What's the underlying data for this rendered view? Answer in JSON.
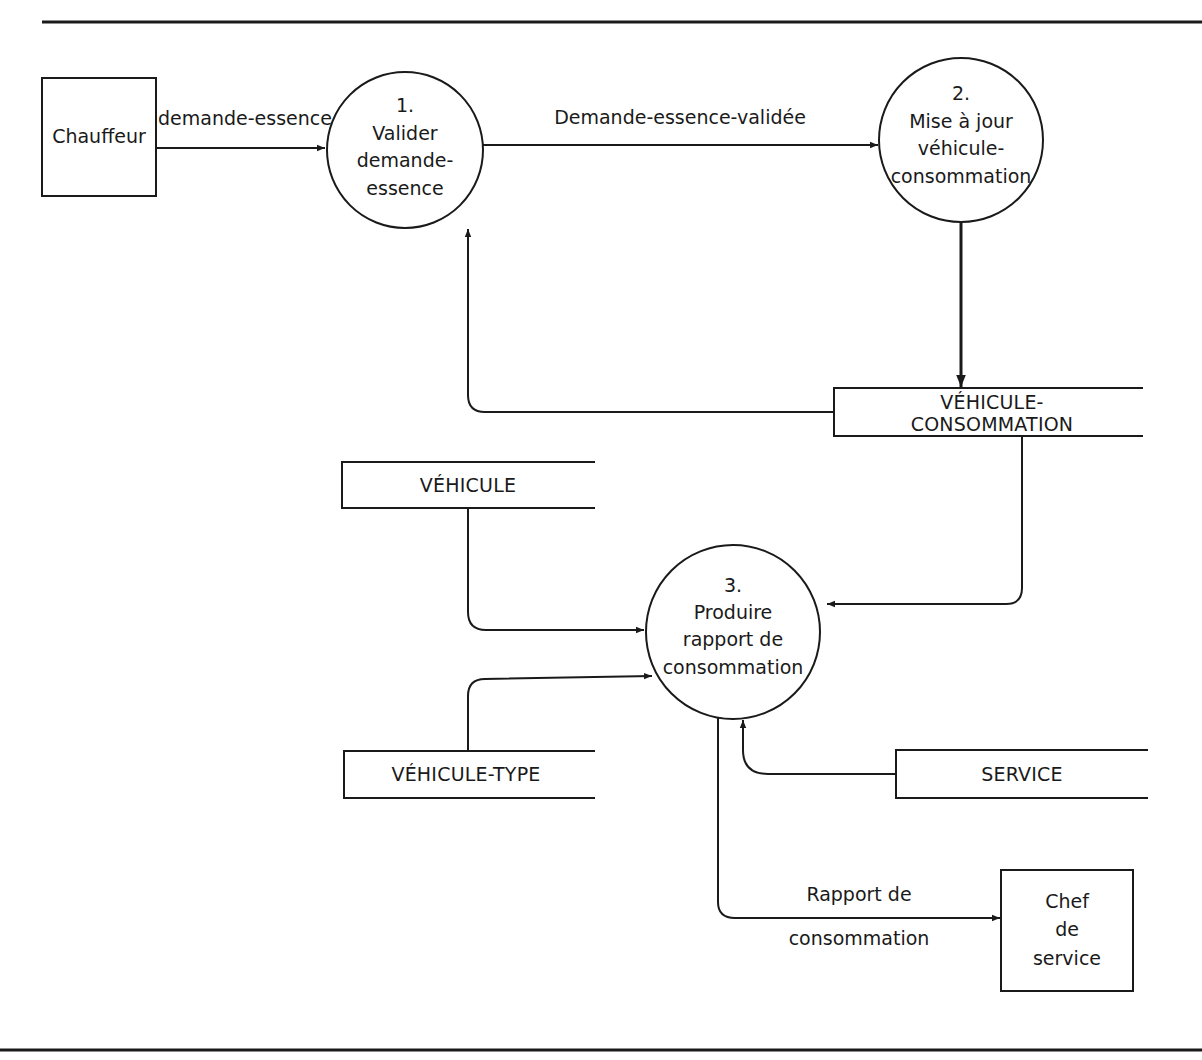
{
  "diagram": {
    "type": "data-flow-diagram",
    "colors": {
      "ink": "#1a1a1a",
      "background": "#ffffff"
    },
    "external_entities": [
      {
        "id": "chauffeur",
        "lines": [
          "Chauffeur"
        ]
      },
      {
        "id": "chef-de-service",
        "lines": [
          "Chef",
          "de",
          "service"
        ]
      }
    ],
    "processes": [
      {
        "id": "p1",
        "number": "1.",
        "lines": [
          "Valider",
          "demande-",
          "essence"
        ]
      },
      {
        "id": "p2",
        "number": "2.",
        "lines": [
          "Mise à jour",
          "véhicule-",
          "consommation"
        ]
      },
      {
        "id": "p3",
        "number": "3.",
        "lines": [
          "Produire",
          "rapport de",
          "consommation"
        ]
      }
    ],
    "data_stores": [
      {
        "id": "vehicule-consommation",
        "lines": [
          "VÉHICULE-",
          "CONSOMMATION"
        ]
      },
      {
        "id": "vehicule",
        "lines": [
          "VÉHICULE"
        ]
      },
      {
        "id": "vehicule-type",
        "lines": [
          "VÉHICULE-TYPE"
        ]
      },
      {
        "id": "service",
        "lines": [
          "SERVICE"
        ]
      }
    ],
    "flows": [
      {
        "from": "chauffeur",
        "to": "p1",
        "label": "demande-essence"
      },
      {
        "from": "p1",
        "to": "p2",
        "label": "Demande-essence-validée"
      },
      {
        "from": "p2",
        "to": "vehicule-consommation",
        "label": ""
      },
      {
        "from": "vehicule-consommation",
        "to": "p1",
        "label": ""
      },
      {
        "from": "vehicule-consommation",
        "to": "p3",
        "label": ""
      },
      {
        "from": "vehicule",
        "to": "p3",
        "label": ""
      },
      {
        "from": "vehicule-type",
        "to": "p3",
        "label": ""
      },
      {
        "from": "service",
        "to": "p3",
        "label": ""
      },
      {
        "from": "p3",
        "to": "chef-de-service",
        "label_lines": [
          "Rapport de",
          "consommation"
        ]
      }
    ]
  }
}
